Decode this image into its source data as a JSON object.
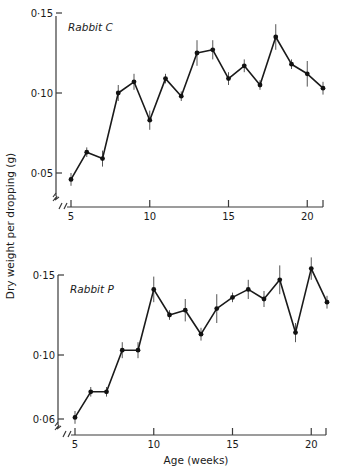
{
  "figure": {
    "ylabel": "Dry weight per dropping (g)",
    "xlabel": "Age (weeks)"
  },
  "panels": [
    {
      "id": "rabbit-c",
      "title": "Rabbit C",
      "y_ticks": [
        {
          "value": 0.15,
          "label": "0·15"
        },
        {
          "value": 0.1,
          "label": "0·10"
        },
        {
          "value": 0.05,
          "label": "0·05"
        }
      ],
      "x_ticks": [
        {
          "value": 5,
          "label": "5"
        },
        {
          "value": 10,
          "label": "10"
        },
        {
          "value": 15,
          "label": "15"
        },
        {
          "value": 20,
          "label": "20"
        }
      ]
    },
    {
      "id": "rabbit-p",
      "title": "Rabbit P",
      "y_ticks": [
        {
          "value": 0.15,
          "label": "0·15"
        },
        {
          "value": 0.1,
          "label": "0·10"
        },
        {
          "value": 0.06,
          "label": "0·06"
        }
      ],
      "x_ticks": [
        {
          "value": 5,
          "label": "5"
        },
        {
          "value": 10,
          "label": "10"
        },
        {
          "value": 15,
          "label": "15"
        },
        {
          "value": 20,
          "label": "20"
        }
      ]
    }
  ],
  "chart_data": [
    {
      "type": "line",
      "title": "Rabbit C",
      "xlabel": "Age (weeks)",
      "ylabel": "Dry weight per dropping (g)",
      "x": [
        5,
        6,
        7,
        8,
        9,
        10,
        11,
        12,
        13,
        14,
        15,
        16,
        17,
        18,
        19,
        20,
        21
      ],
      "series": [
        {
          "name": "Rabbit C",
          "values": [
            0.046,
            0.063,
            0.059,
            0.1,
            0.107,
            0.083,
            0.109,
            0.098,
            0.125,
            0.127,
            0.109,
            0.117,
            0.105,
            0.135,
            0.118,
            0.112,
            0.103
          ],
          "error": [
            0.004,
            0.003,
            0.005,
            0.005,
            0.005,
            0.006,
            0.003,
            0.003,
            0.008,
            0.006,
            0.004,
            0.004,
            0.003,
            0.008,
            0.003,
            0.008,
            0.004
          ]
        }
      ],
      "xlim": [
        4.7,
        21
      ],
      "ylim": [
        0.03,
        0.15
      ],
      "y_axis_break": true,
      "x_axis_break": true,
      "grid": false,
      "legend": "none (panel label top-left)"
    },
    {
      "type": "line",
      "title": "Rabbit P",
      "xlabel": "Age (weeks)",
      "ylabel": "Dry weight per dropping (g)",
      "x": [
        5,
        6,
        7,
        8,
        9,
        10,
        11,
        12,
        13,
        14,
        15,
        16,
        17,
        18,
        19,
        20,
        21
      ],
      "series": [
        {
          "name": "Rabbit P",
          "values": [
            0.061,
            0.077,
            0.077,
            0.103,
            0.103,
            0.141,
            0.125,
            0.128,
            0.113,
            0.129,
            0.136,
            0.141,
            0.135,
            0.147,
            0.114,
            0.154,
            0.133
          ],
          "error": [
            0.004,
            0.003,
            0.003,
            0.005,
            0.005,
            0.008,
            0.003,
            0.007,
            0.004,
            0.009,
            0.003,
            0.006,
            0.005,
            0.009,
            0.006,
            0.007,
            0.004
          ]
        }
      ],
      "xlim": [
        4.7,
        21
      ],
      "ylim": [
        0.05,
        0.15
      ],
      "y_axis_break": true,
      "x_axis_break": true,
      "grid": false,
      "legend": "none (panel label top-left)"
    }
  ]
}
